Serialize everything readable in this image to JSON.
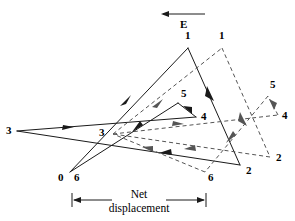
{
  "figure": {
    "type": "vector-displacement-diagram",
    "direction_marker": {
      "label": "E",
      "arrow": "left-arrow-icon",
      "x1": 205,
      "y1": 14,
      "x2": 162,
      "y2": 14
    },
    "scale_bar": {
      "line1": "Net",
      "line2": "displacement",
      "arrow": "double-headed-arrow-icon",
      "x_left": 72,
      "x_right": 206,
      "y": 200
    },
    "solid_path": {
      "style": "solid",
      "color": "#1a1a1a",
      "points": [
        {
          "label": "0",
          "x": 70,
          "y": 172,
          "lx": 58,
          "ly": 173
        },
        {
          "label": "1",
          "x": 188,
          "y": 48,
          "lx": 185,
          "ly": 31
        },
        {
          "label": "2",
          "x": 240,
          "y": 165,
          "lx": 246,
          "ly": 166
        },
        {
          "label": "3",
          "x": 17,
          "y": 131,
          "lx": 6,
          "ly": 125
        },
        {
          "label": "4",
          "x": 196,
          "y": 117,
          "lx": 201,
          "ly": 112
        },
        {
          "label": "5",
          "x": 178,
          "y": 103,
          "lx": 181,
          "ly": 88
        },
        {
          "label": "6",
          "x": 70,
          "y": 172,
          "lx": 74,
          "ly": 173
        }
      ]
    },
    "dashed_path": {
      "style": "dashed",
      "color": "#555555",
      "points": [
        {
          "label": "0",
          "x": 113,
          "y": 134,
          "lx": null,
          "ly": null
        },
        {
          "label": "1",
          "x": 222,
          "y": 48,
          "lx": 219,
          "ly": 31
        },
        {
          "label": "2",
          "x": 270,
          "y": 157,
          "lx": 276,
          "ly": 152
        },
        {
          "label": "3",
          "x": 113,
          "y": 134,
          "lx": 99,
          "ly": 127
        },
        {
          "label": "4",
          "x": 278,
          "y": 115,
          "lx": 282,
          "ly": 110
        },
        {
          "label": "5",
          "x": 268,
          "y": 96,
          "lx": 270,
          "ly": 79
        },
        {
          "label": "6",
          "x": 205,
          "y": 172,
          "lx": 208,
          "ly": 172
        }
      ]
    }
  }
}
